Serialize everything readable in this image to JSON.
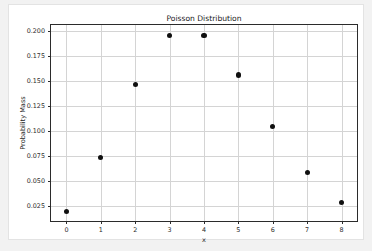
{
  "chart_data": {
    "type": "scatter",
    "title": "Poisson Distribution",
    "xlabel": "x",
    "ylabel": "Probability Mass",
    "x": [
      0,
      1,
      2,
      3,
      4,
      5,
      6,
      7,
      8
    ],
    "values": [
      0.0302,
      0.1057,
      0.185,
      0.2158,
      0.1888,
      0.1322,
      0.0771,
      0.0385,
      0.0169
    ],
    "categories": [
      "0",
      "1",
      "2",
      "3",
      "4",
      "5",
      "6",
      "7",
      "8"
    ],
    "series": [
      {
        "name": "Probability Mass",
        "values": [
          0.0198,
          0.0735,
          0.1462,
          0.195,
          0.195,
          0.1558,
          0.1042,
          0.0588,
          0.0292
        ]
      }
    ],
    "xtick_labels": [
      "0",
      "1",
      "2",
      "3",
      "4",
      "5",
      "6",
      "7",
      "8"
    ],
    "xtick_values": [
      0,
      1,
      2,
      3,
      4,
      5,
      6,
      7,
      8
    ],
    "ytick_labels": [
      "0.025",
      "0.050",
      "0.075",
      "0.100",
      "0.125",
      "0.150",
      "0.175",
      "0.200"
    ],
    "ytick_values": [
      0.025,
      0.05,
      0.075,
      0.1,
      0.125,
      0.15,
      0.175,
      0.2
    ],
    "xlim": [
      -0.45,
      8.45
    ],
    "ylim": [
      0.0105,
      0.2055
    ],
    "grid": true,
    "legend": null,
    "marker_color": "#101010",
    "grid_color": "#d4d4d4",
    "axis_color": "#2b2b2b",
    "figure_background": "#ffffff",
    "page_background": "#f2f2f2"
  }
}
